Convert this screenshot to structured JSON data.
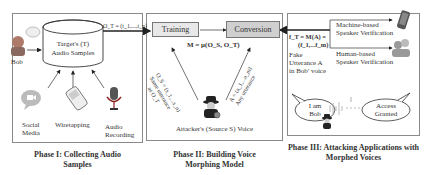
{
  "phase1": {
    "caption_line1": "Phase I: Collecting Audio",
    "caption_line2": "Samples",
    "person_label": "Bob",
    "database_line1": "Target's (T)",
    "database_line2": "Audio Samples",
    "output_label": "O_T = (t_1,...,t_n)",
    "sources": [
      {
        "line1": "Social",
        "line2": "Media",
        "icon": "chat-video-icon"
      },
      {
        "line1": "Wiretapping",
        "line2": "",
        "icon": "phone-icon"
      },
      {
        "line1": "Audio",
        "line2": "Recording",
        "icon": "microphone-icon"
      }
    ]
  },
  "phase2": {
    "caption_line1": "Phase II: Building Voice",
    "caption_line2": "Morphing Model",
    "training_label": "Training",
    "conversion_label": "Conversion",
    "model_formula": "M = μ(O_S, O_T)",
    "left_arrow_line1": "O_S = (s_1,...s_n)",
    "left_arrow_line2": "Same utterance",
    "left_arrow_line3": "as O_T",
    "right_arrow_line1": "A = (a_1,...a_m)",
    "right_arrow_line2": "Any utterance",
    "attacker_label": "Attacker's (Source S) Voice"
  },
  "phase3": {
    "caption_line1": "Phase III: Attacking Applications with",
    "caption_line2": "Morphed Voices",
    "formula_line1": "f_T = M(A) =",
    "formula_line2": "(f_1,...f_m)",
    "fake_line1": "Fake",
    "fake_line2": "Utterance A",
    "fake_line3": "in Bob' voice",
    "machine_line1": "Machine-based",
    "machine_line2": "Speaker Verification",
    "human_line1": "Human-based",
    "human_line2": "Speaker Verification",
    "bubble_left_line1": "I am",
    "bubble_left_line2": "Bob",
    "bubble_right_line1": "Access",
    "bubble_right_line2": "Granted"
  }
}
